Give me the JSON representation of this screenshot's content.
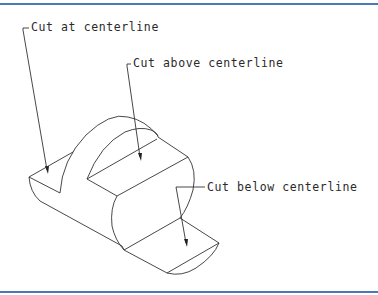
{
  "frame": {
    "border_color": "#4a78b8"
  },
  "drawing": {
    "title": "Cylindrical part with cutting plane examples",
    "line_color": "#333333",
    "labels": [
      {
        "id": "cut-at",
        "text": "Cut at centerline"
      },
      {
        "id": "cut-above",
        "text": "Cut above centerline"
      },
      {
        "id": "cut-below",
        "text": "Cut below centerline"
      }
    ]
  }
}
